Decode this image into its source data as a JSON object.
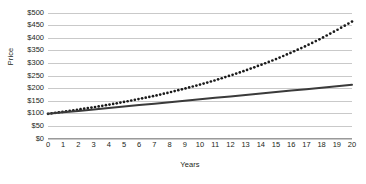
{
  "chart_data": {
    "type": "line",
    "title": "",
    "xlabel": "Years",
    "ylabel": "Price",
    "x": [
      0,
      1,
      2,
      3,
      4,
      5,
      6,
      7,
      8,
      9,
      10,
      11,
      12,
      13,
      14,
      15,
      16,
      17,
      18,
      19,
      20
    ],
    "xticklabels": [
      "0",
      "1",
      "2",
      "3",
      "4",
      "5",
      "6",
      "7",
      "8",
      "9",
      "10",
      "11",
      "12",
      "13",
      "14",
      "15",
      "16",
      "17",
      "18",
      "19",
      "20"
    ],
    "yticklabels": [
      "$0",
      "$50",
      "$100",
      "$150",
      "$200",
      "$250",
      "$300",
      "$350",
      "$400",
      "$450",
      "$500"
    ],
    "ytickvalues": [
      0,
      50,
      100,
      150,
      200,
      250,
      300,
      350,
      400,
      450,
      500
    ],
    "ylim": [
      0,
      500
    ],
    "xlim": [
      0,
      20
    ],
    "grid": true,
    "legend": "none",
    "series": [
      {
        "name": "compound-growth",
        "style": "dotted",
        "color": "#1a1a1a",
        "values": [
          100,
          108,
          117,
          126,
          136,
          147,
          159,
          171,
          185,
          200,
          216,
          233,
          252,
          272,
          294,
          317,
          343,
          370,
          400,
          432,
          466
        ]
      },
      {
        "name": "linear-growth",
        "style": "solid",
        "color": "#3a3a3a",
        "values": [
          100,
          105.8,
          111.5,
          117.3,
          123,
          128.8,
          134.5,
          140.3,
          146,
          151.8,
          157.5,
          163.3,
          169,
          174.8,
          180.5,
          186.3,
          192,
          197.8,
          203.5,
          209.3,
          215
        ]
      }
    ]
  }
}
